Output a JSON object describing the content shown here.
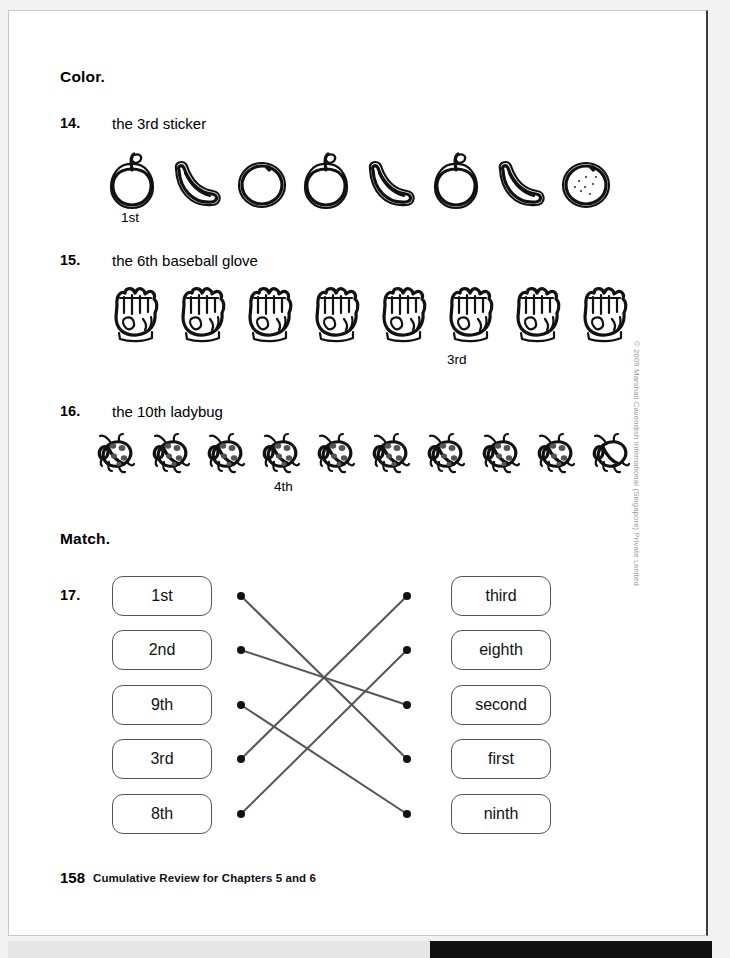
{
  "page": {
    "footer_number": "158",
    "footer_text": "Cumulative Review for Chapters 5 and 6",
    "copyright": "© 2009 Marshall Cavendish International (Singapore) Private Limited"
  },
  "sections": {
    "color_heading": "Color.",
    "match_heading": "Match."
  },
  "questions": [
    {
      "number": "14.",
      "prompt": "the 3rd sticker",
      "row_label": "1st",
      "row_label_index": 1,
      "count": 8,
      "shaded_index": 3,
      "items": [
        "apple",
        "banana",
        "orange",
        "apple",
        "banana",
        "apple",
        "banana",
        "orange"
      ]
    },
    {
      "number": "15.",
      "prompt": "the 6th baseball glove",
      "row_label": "3rd",
      "row_label_index": 6,
      "count": 8,
      "shaded_index": 3,
      "items": [
        "glove",
        "glove",
        "glove",
        "glove",
        "glove",
        "glove",
        "glove",
        "glove"
      ]
    },
    {
      "number": "16.",
      "prompt": "the 10th ladybug",
      "row_label": "4th",
      "row_label_index": 4,
      "count": 10,
      "shaded_index": 10,
      "items": [
        "ladybug",
        "ladybug",
        "ladybug",
        "ladybug",
        "ladybug",
        "ladybug",
        "ladybug",
        "ladybug",
        "ladybug",
        "ladybug"
      ]
    },
    {
      "number": "17.",
      "prompt": "",
      "left_options": [
        "1st",
        "2nd",
        "9th",
        "3rd",
        "8th"
      ],
      "right_options": [
        "third",
        "eighth",
        "second",
        "first",
        "ninth"
      ],
      "connections": [
        {
          "left": 0,
          "right": 3
        },
        {
          "left": 1,
          "right": 2
        },
        {
          "left": 2,
          "right": 4
        },
        {
          "left": 3,
          "right": 0
        },
        {
          "left": 4,
          "right": 1
        }
      ]
    }
  ],
  "colors": {
    "ink": "#111111",
    "page": "#ffffff",
    "background": "#f2f2f2",
    "box_border": "#555555",
    "line": "#555555",
    "copyright_text": "#9a9a9a"
  }
}
